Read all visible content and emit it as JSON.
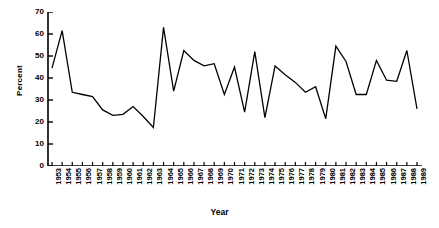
{
  "chart_data": {
    "type": "line",
    "title": "",
    "xlabel": "Year",
    "ylabel": "Percent",
    "xlim": [
      1953,
      1989
    ],
    "ylim": [
      0,
      70
    ],
    "ytick_values": [
      0,
      10,
      20,
      30,
      40,
      50,
      60,
      70
    ],
    "ytick_labels": [
      "0",
      "10",
      "20",
      "30",
      "40",
      "50",
      "60",
      "70"
    ],
    "grid": false,
    "legend": "none",
    "line_color": "#000000",
    "axis_color": "#000000",
    "background_color": "#ffffff",
    "categories": [
      "1953",
      "1954",
      "1955",
      "1956",
      "1957",
      "1958",
      "1959",
      "1960",
      "1961",
      "1962",
      "1963",
      "1964",
      "1965",
      "1966",
      "1967",
      "1968",
      "1969",
      "1970",
      "1971",
      "1972",
      "1973",
      "1974",
      "1975",
      "1976",
      "1977",
      "1978",
      "1979",
      "1980",
      "1981",
      "1982",
      "1983",
      "1984",
      "1985",
      "1986",
      "1987",
      "1988",
      "1989"
    ],
    "values": [
      44.5,
      61.5,
      33.5,
      32.5,
      31.5,
      25.5,
      23.0,
      23.5,
      27.0,
      22.5,
      17.5,
      63.0,
      34.0,
      52.5,
      48.0,
      45.5,
      46.5,
      32.5,
      45.0,
      24.5,
      52.0,
      22.0,
      45.5,
      41.5,
      38.0,
      33.5,
      36.0,
      21.5,
      54.5,
      47.5,
      32.5,
      32.5,
      48.0,
      39.0,
      38.5,
      52.5,
      26.0
    ]
  }
}
